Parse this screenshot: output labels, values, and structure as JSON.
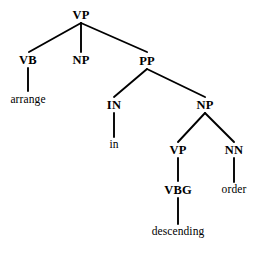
{
  "figure": {
    "kind": "constituency-parse-tree",
    "sentence": "arrange in descending order",
    "background_color": "#ffffff",
    "stroke_color": "#000000",
    "text_color": "#000000"
  },
  "nodes": {
    "root_vp": "VP",
    "vb": "VB",
    "np1": "NP",
    "pp": "PP",
    "in": "IN",
    "np2": "NP",
    "vp2": "VP",
    "nn": "NN",
    "vbg": "VBG"
  },
  "leaves": {
    "arrange": "arrange",
    "in_word": "in",
    "descending": "descending",
    "order": "order"
  }
}
